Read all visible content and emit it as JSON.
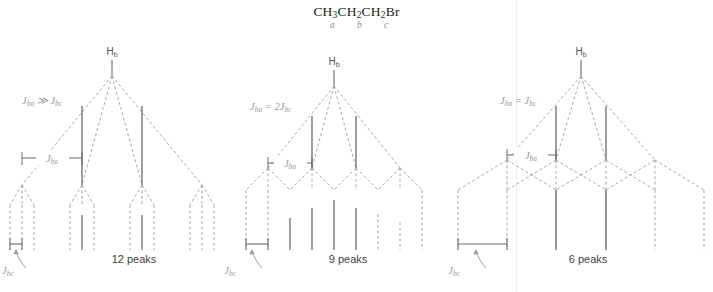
{
  "title": {
    "formula_parts": [
      {
        "t": "CH",
        "sub": "3"
      },
      {
        "t": "CH",
        "sub": "2"
      },
      {
        "t": "CH",
        "sub": "2"
      },
      {
        "t": "Br",
        "sub": ""
      }
    ],
    "formula_plain": "CH3CH2CH2Br",
    "carbon_labels": [
      "a",
      "b",
      "c"
    ]
  },
  "trees": [
    {
      "id": "tree-1",
      "proton_label": "H",
      "proton_sub": "b",
      "coupling_relation": "J",
      "coupling_relation_sub1": "ba",
      "coupling_relation_op": " ≫ ",
      "coupling_relation_j2": "J",
      "coupling_relation_sub2": "bc",
      "relation_plain": "Jba >> Jbc",
      "bracket_upper": "J",
      "bracket_upper_sub": "ba",
      "bracket_lower": "J",
      "bracket_lower_sub": "bc",
      "peak_count_label": "12 peaks",
      "peak_count": 12,
      "first_split": 4,
      "second_split": 3,
      "pattern": "quartet of triplets, no overlap",
      "peak_intensities": [
        1,
        1,
        1,
        1,
        2,
        2,
        1,
        2,
        2,
        1,
        1,
        1
      ]
    },
    {
      "id": "tree-2",
      "proton_label": "H",
      "proton_sub": "b",
      "coupling_relation": "J",
      "coupling_relation_sub1": "ba",
      "coupling_relation_op": " = 2",
      "coupling_relation_j2": "J",
      "coupling_relation_sub2": "bc",
      "relation_plain": "Jba = 2Jbc",
      "bracket_upper": "J",
      "bracket_upper_sub": "ba",
      "bracket_lower": "J",
      "bracket_lower_sub": "bc",
      "peak_count_label": "9 peaks",
      "peak_count": 9,
      "first_split": 4,
      "second_split": 3,
      "pattern": "quartet of triplets, partial overlap",
      "peak_intensities": [
        1,
        1,
        2,
        3,
        3,
        3,
        2,
        1,
        1
      ]
    },
    {
      "id": "tree-3",
      "proton_label": "H",
      "proton_sub": "b",
      "coupling_relation": "J",
      "coupling_relation_sub1": "ba",
      "coupling_relation_op": " = ",
      "coupling_relation_j2": "J",
      "coupling_relation_sub2": "bc",
      "relation_plain": "Jba = Jbc",
      "bracket_upper": "J",
      "bracket_upper_sub": "ba",
      "bracket_lower": "J",
      "bracket_lower_sub": "bc",
      "peak_count_label": "6 peaks",
      "peak_count": 6,
      "first_split": 4,
      "second_split": 3,
      "pattern": "sextet, full overlap",
      "peak_intensities": [
        1,
        2,
        3,
        3,
        2,
        1
      ]
    }
  ],
  "colors": {
    "line_solid": "#6b6b6b",
    "line_dashed": "#a8a8a8",
    "label_gray": "#9a9a9a",
    "text_dark": "#3f3f3f",
    "background": "#ffffff"
  }
}
